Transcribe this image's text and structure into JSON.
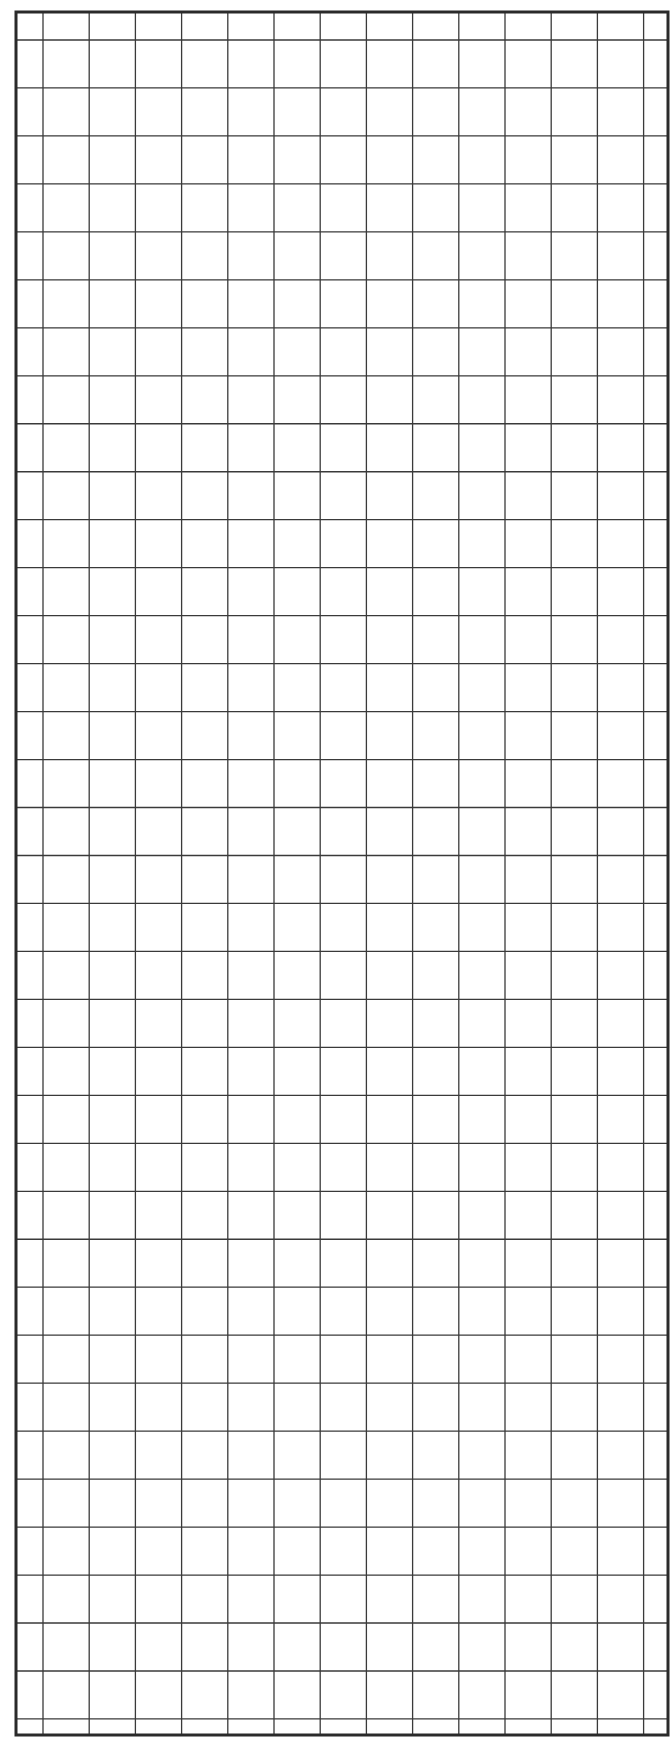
{
  "sheet": {
    "type": "graph-paper",
    "width": 671,
    "height": 1738,
    "background": "#ffffff",
    "line_color": "#3a3a3a",
    "border_color": "#2a2a2a",
    "border": {
      "left": 16,
      "top": 12,
      "right": 668,
      "bottom": 1735,
      "stroke_width": 3
    },
    "vertical_lines": {
      "start": 43,
      "spacing": 46.2,
      "count": 14,
      "stroke_width": 1.3
    },
    "horizontal_lines": {
      "start": 40,
      "spacing": 47.97,
      "count": 36,
      "stroke_width": 1.3
    }
  }
}
